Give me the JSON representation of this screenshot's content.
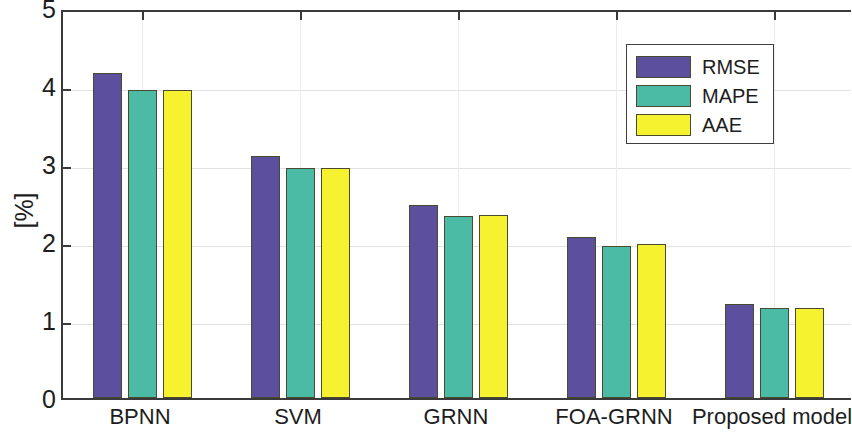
{
  "chart_data": {
    "type": "bar",
    "title": "",
    "xlabel": "",
    "ylabel": "[%]",
    "ylim": [
      0,
      5
    ],
    "yticks": [
      0,
      1,
      2,
      3,
      4,
      5
    ],
    "ytick_labels": [
      "0",
      "1",
      "2",
      "3",
      "4",
      "5"
    ],
    "grid": true,
    "legend_position": "top-right",
    "categories": [
      "BPNN",
      "SVM",
      "GRNN",
      "FOA-GRNN",
      "Proposed model"
    ],
    "series": [
      {
        "name": "RMSE",
        "color": "#5b4f9e",
        "values": [
          4.17,
          3.1,
          2.48,
          2.07,
          1.2
        ]
      },
      {
        "name": "MAPE",
        "color": "#4cbba5",
        "values": [
          3.95,
          2.95,
          2.33,
          1.95,
          1.16
        ]
      },
      {
        "name": "AAE",
        "color": "#f7f230",
        "values": [
          3.95,
          2.95,
          2.34,
          1.98,
          1.15
        ]
      }
    ]
  },
  "legend": {
    "entries": [
      {
        "label": "RMSE"
      },
      {
        "label": "MAPE"
      },
      {
        "label": "AAE"
      }
    ]
  },
  "axes": {
    "y_label": "[%]"
  }
}
